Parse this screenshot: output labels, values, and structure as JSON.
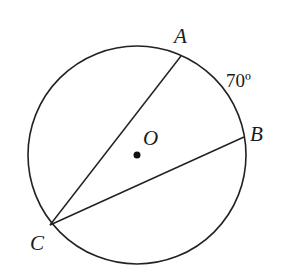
{
  "diagram": {
    "type": "circle-inscribed-angle",
    "circle": {
      "center": {
        "label": "O",
        "x": 137,
        "y": 155
      },
      "radius": 109,
      "stroke": "#222222"
    },
    "points": [
      {
        "label": "A",
        "x": 181,
        "y": 56
      },
      {
        "label": "B",
        "x": 244,
        "y": 137
      },
      {
        "label": "C",
        "x": 50,
        "y": 225
      }
    ],
    "chords": [
      {
        "from": "C",
        "to": "A"
      },
      {
        "from": "C",
        "to": "B"
      }
    ],
    "arc_label": {
      "arc": "AB",
      "text": "70º"
    }
  },
  "labels": {
    "A": "A",
    "B": "B",
    "C": "C",
    "O": "O",
    "arc": "70º"
  }
}
